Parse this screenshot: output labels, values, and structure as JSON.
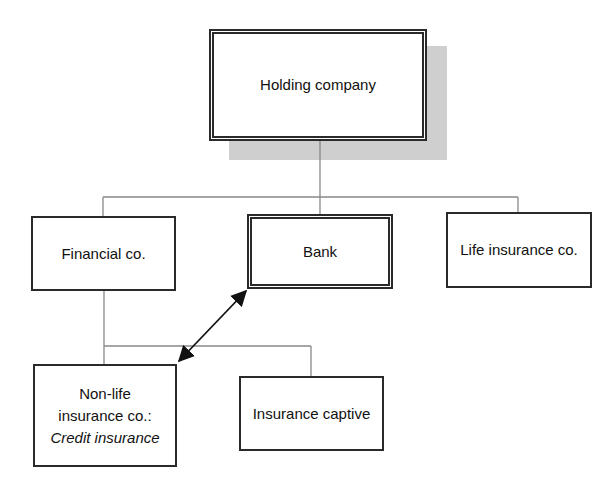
{
  "diagram": {
    "type": "organizational-structure",
    "nodes": {
      "holding": {
        "label": "Holding company",
        "style": "double-border-with-shadow"
      },
      "financial": {
        "label": "Financial co.",
        "style": "single-border"
      },
      "bank": {
        "label": "Bank",
        "style": "double-border"
      },
      "life": {
        "label": "Life insurance co.",
        "style": "single-border"
      },
      "nonlife": {
        "line1": "Non-life",
        "line2": "insurance co.:",
        "line3": "Credit insurance",
        "style": "single-border"
      },
      "captive": {
        "label": "Insurance captive",
        "style": "single-border"
      }
    },
    "edges": [
      {
        "from": "Holding company",
        "to": "Financial co.",
        "kind": "ownership-line"
      },
      {
        "from": "Holding company",
        "to": "Bank",
        "kind": "ownership-line"
      },
      {
        "from": "Holding company",
        "to": "Life insurance co.",
        "kind": "ownership-line"
      },
      {
        "from": "Financial co.",
        "to": "Non-life insurance co.: Credit insurance",
        "kind": "ownership-line"
      },
      {
        "from": "Financial co.",
        "to": "Insurance captive",
        "kind": "ownership-line"
      },
      {
        "from": "Bank",
        "to": "Non-life insurance co.: Credit insurance",
        "kind": "bidirectional-arrow"
      }
    ],
    "colors": {
      "line": "#888888",
      "border": "#2a2a2a",
      "shadow": "#cfcfcf",
      "arrow": "#111111"
    }
  }
}
